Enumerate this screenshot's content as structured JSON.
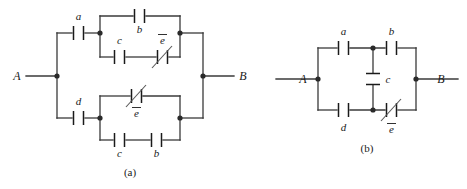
{
  "figure": {
    "line_color": "#3a3a3a",
    "text_color": "#1a1a1a",
    "background": "#ffffff"
  },
  "captions": {
    "a": "(a)",
    "b": "(b)"
  },
  "terminals": {
    "a_left": "A",
    "a_right": "B",
    "b_left": "A",
    "b_right": "B"
  },
  "circuit_a": {
    "name": "(a)",
    "components": [
      {
        "id": "a-a",
        "label": "a",
        "barred": false,
        "slashed": false,
        "orientation": "vertical-plates"
      },
      {
        "id": "a-b-top",
        "label": "b",
        "barred": false,
        "slashed": false,
        "orientation": "vertical-plates"
      },
      {
        "id": "a-c-upper",
        "label": "c",
        "barred": false,
        "slashed": false,
        "orientation": "vertical-plates"
      },
      {
        "id": "a-ebar-upper",
        "label": "e",
        "barred": true,
        "slashed": true,
        "orientation": "vertical-plates"
      },
      {
        "id": "a-d",
        "label": "d",
        "barred": false,
        "slashed": false,
        "orientation": "vertical-plates"
      },
      {
        "id": "a-ebar-lower",
        "label": "e",
        "barred": true,
        "slashed": true,
        "orientation": "vertical-plates"
      },
      {
        "id": "a-c-lower",
        "label": "c",
        "barred": false,
        "slashed": false,
        "orientation": "vertical-plates"
      },
      {
        "id": "a-b-lower",
        "label": "b",
        "barred": false,
        "slashed": false,
        "orientation": "vertical-plates"
      }
    ]
  },
  "circuit_b": {
    "name": "(b)",
    "components": [
      {
        "id": "b-a",
        "label": "a",
        "barred": false,
        "slashed": false,
        "orientation": "vertical-plates"
      },
      {
        "id": "b-b",
        "label": "b",
        "barred": false,
        "slashed": false,
        "orientation": "vertical-plates"
      },
      {
        "id": "b-c",
        "label": "c",
        "barred": false,
        "slashed": false,
        "orientation": "horizontal-plates"
      },
      {
        "id": "b-d",
        "label": "d",
        "barred": false,
        "slashed": false,
        "orientation": "vertical-plates"
      },
      {
        "id": "b-ebar",
        "label": "e",
        "barred": true,
        "slashed": true,
        "orientation": "vertical-plates"
      }
    ]
  },
  "labels": {
    "a_cap_a": "a",
    "a_cap_b_top": "b",
    "a_cap_c_upper": "c",
    "a_cap_e_upper": "e",
    "a_cap_d": "d",
    "a_cap_e_lower": "e",
    "a_cap_c_lower": "c",
    "a_cap_b_lower": "b",
    "b_cap_a": "a",
    "b_cap_b": "b",
    "b_cap_c": "c",
    "b_cap_d": "d",
    "b_cap_e": "e"
  }
}
